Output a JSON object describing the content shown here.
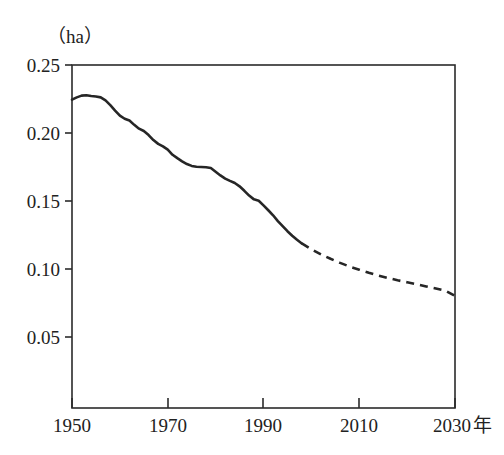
{
  "chart_data": {
    "type": "line",
    "title": "",
    "subtitle": "",
    "xlabel": "年",
    "ylabel": "",
    "unit_label": "（ha）",
    "year_suffix": "年",
    "xlim": [
      1950,
      2030
    ],
    "ylim": [
      0.0,
      0.25
    ],
    "grid": false,
    "legend": "none",
    "y_ticks": [
      0.05,
      0.1,
      0.15,
      0.2,
      0.25
    ],
    "y_tick_labels": [
      "0.05",
      "0.10",
      "0.15",
      "0.20",
      "0.25"
    ],
    "x_ticks": [
      1950,
      1970,
      1990,
      2010,
      2030
    ],
    "x_tick_labels": [
      "1950",
      "1970",
      "1990",
      "2010",
      "2030"
    ],
    "series": [
      {
        "name": "actual",
        "style": "solid",
        "x": [
          1950,
          1951,
          1952,
          1953,
          1954,
          1955,
          1956,
          1957,
          1958,
          1959,
          1960,
          1961,
          1962,
          1963,
          1964,
          1965,
          1966,
          1967,
          1968,
          1969,
          1970,
          1971,
          1972,
          1973,
          1974,
          1975,
          1976,
          1977,
          1978,
          1979,
          1980,
          1981,
          1982,
          1983,
          1984,
          1985,
          1986,
          1987,
          1988,
          1989,
          1990,
          1991,
          1992,
          1993,
          1994,
          1995,
          1996,
          1997,
          1998
        ],
        "values": [
          0.2245,
          0.2262,
          0.2275,
          0.2278,
          0.2272,
          0.2268,
          0.2262,
          0.224,
          0.2205,
          0.2165,
          0.2128,
          0.2105,
          0.2092,
          0.206,
          0.2032,
          0.2015,
          0.1985,
          0.1948,
          0.192,
          0.1902,
          0.1878,
          0.184,
          0.1815,
          0.1792,
          0.1772,
          0.1758,
          0.1752,
          0.175,
          0.1748,
          0.1742,
          0.1715,
          0.1688,
          0.1665,
          0.1648,
          0.1632,
          0.1608,
          0.1575,
          0.154,
          0.1512,
          0.1502,
          0.1468,
          0.1432,
          0.1395,
          0.1352,
          0.1315,
          0.1278,
          0.1245,
          0.1215,
          0.1188
        ]
      },
      {
        "name": "projection",
        "style": "dashed",
        "x": [
          1998,
          2000,
          2002,
          2004,
          2006,
          2008,
          2010,
          2012,
          2014,
          2016,
          2018,
          2020,
          2022,
          2024,
          2026,
          2028,
          2030
        ],
        "values": [
          0.1188,
          0.1145,
          0.1108,
          0.1075,
          0.1045,
          0.1018,
          0.0995,
          0.0972,
          0.0952,
          0.0934,
          0.0917,
          0.0902,
          0.0888,
          0.0872,
          0.0856,
          0.084,
          0.0802
        ]
      }
    ],
    "annotations": []
  },
  "axes": {
    "unit_caption": "（ha）",
    "x_axis_suffix": "年"
  }
}
